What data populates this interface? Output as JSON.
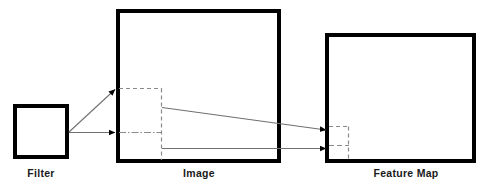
{
  "diagram": {
    "labels": {
      "filter": "Filter",
      "image": "Image",
      "feature_map": "Feature Map"
    },
    "colors": {
      "stroke": "#000000",
      "text": "#1a1a1a",
      "connector": "#666666",
      "dashed": "#999999",
      "background": "#ffffff"
    },
    "shapes": {
      "filter_box": {
        "x": 13,
        "y": 104,
        "width": 56,
        "height": 55,
        "border_width": 4
      },
      "image_box": {
        "x": 116,
        "y": 9,
        "width": 165,
        "height": 154,
        "border_width": 4
      },
      "feature_map_box": {
        "x": 325,
        "y": 33,
        "width": 151,
        "height": 130,
        "border_width": 4
      },
      "image_receptive_field": {
        "x": 118,
        "y": 88,
        "width": 44,
        "height": 46
      },
      "feature_map_cell": {
        "x": 327,
        "y": 126,
        "width": 21,
        "height": 35
      }
    },
    "connectors": [
      {
        "name": "filter-to-image-top",
        "from": [
          69,
          132
        ],
        "to": [
          117,
          89
        ],
        "style": "solid-arrow"
      },
      {
        "name": "filter-to-image-middle",
        "from": [
          69,
          132
        ],
        "to": [
          117,
          132
        ],
        "style": "solid-arrow"
      },
      {
        "name": "image-region-to-feature-top",
        "from": [
          162,
          108
        ],
        "to": [
          328,
          130
        ],
        "style": "solid-arrow"
      },
      {
        "name": "image-region-to-feature-bottom",
        "from": [
          162,
          148
        ],
        "to": [
          328,
          148
        ],
        "style": "solid-arrow"
      }
    ]
  }
}
